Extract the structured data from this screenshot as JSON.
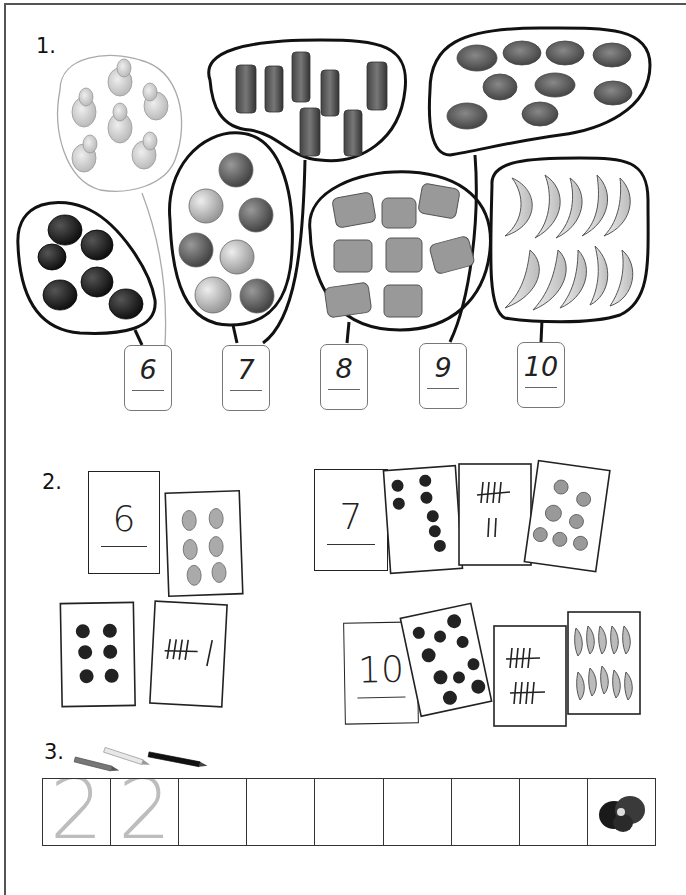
{
  "worksheet": {
    "exercises": [
      {
        "number": "1.",
        "groups": [
          {
            "item": "pear",
            "count": 7,
            "outline": "light"
          },
          {
            "item": "tomato",
            "count": 6,
            "outline": "bold"
          },
          {
            "item": "bottle",
            "count": 7,
            "outline": "bold"
          },
          {
            "item": "apple",
            "count": 8,
            "outline": "bold"
          },
          {
            "item": "sandwich",
            "count": 8,
            "outline": "bold"
          },
          {
            "item": "bread-roll",
            "count": 9,
            "outline": "bold"
          },
          {
            "item": "banana",
            "count": 10,
            "outline": "bold"
          }
        ],
        "number_boxes": [
          "6",
          "7",
          "8",
          "9",
          "10"
        ]
      },
      {
        "number": "2.",
        "card_sets": [
          {
            "numeral": "6",
            "cards": [
              "6 pears",
              "6 dots",
              "tally 5 + 1"
            ]
          },
          {
            "numeral": "7",
            "cards": [
              "7 dots",
              "tally 5 + 2",
              "7 apples"
            ]
          },
          {
            "numeral": "10",
            "cards": [
              "10 dots",
              "tally 5 + 5",
              "10 bananas"
            ]
          }
        ]
      },
      {
        "number": "3.",
        "traced_digits": [
          "2",
          "2"
        ],
        "empty_cells": 7,
        "end_icon": "flower-icon",
        "pencil_icons": [
          "pencil-gray-icon",
          "pencil-light-icon",
          "pencil-black-icon"
        ]
      }
    ]
  }
}
